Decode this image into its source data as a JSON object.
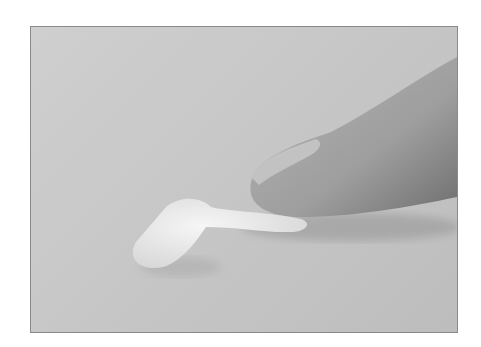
{
  "image": {
    "description": "Fingertip pressing on a strip of white cream on a gray textured surface",
    "colors": {
      "background": "#c8c8c8",
      "border": "#8a8a8a",
      "finger": "#a9a9a9",
      "finger_shadow": "#7e7e7e",
      "nail": "#b8b8b8",
      "cream": "#ececec",
      "cream_shadow": "#d4d4d4"
    }
  }
}
